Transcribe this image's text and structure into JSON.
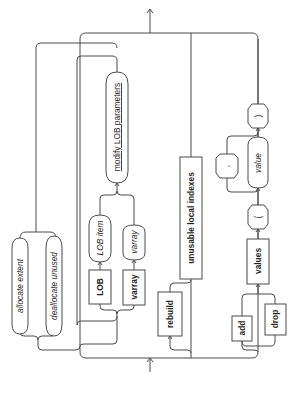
{
  "diagram": {
    "type": "syntax-railroad-diagram",
    "orientation": "rotated 90 degrees counter-clockwise (flows bottom to top)",
    "entry_arrow": "bottom",
    "exit_arrow": "top",
    "colors": {
      "line": "#4a4a4a",
      "text": "#1e1e1e",
      "background": "#ffffff"
    }
  },
  "branches": {
    "allocate_group": {
      "items": [
        {
          "label": "allocate extent",
          "style": "italic",
          "shape": "rounded"
        },
        {
          "label": "deallocate unused",
          "style": "italic",
          "shape": "rounded"
        }
      ]
    },
    "lob_group": {
      "items": [
        {
          "label": "LOB",
          "style": "bold",
          "shape": "box"
        },
        {
          "label": "LOB item",
          "style": "italic",
          "shape": "rounded"
        },
        {
          "label": "varray",
          "style": "bold",
          "shape": "box"
        },
        {
          "label": "varray",
          "style": "italic",
          "shape": "rounded"
        }
      ],
      "after": {
        "label": "modify LOB parameters",
        "style": "underline",
        "shape": "rounded"
      }
    },
    "rebuild_group": {
      "optional": {
        "label": "rebuild",
        "style": "bold",
        "shape": "box"
      },
      "keyword": {
        "label": "unusable local indexes",
        "style": "bold",
        "shape": "box"
      }
    },
    "values_group": {
      "choice": [
        {
          "label": "add",
          "style": "bold",
          "shape": "box"
        },
        {
          "label": "drop",
          "style": "bold",
          "shape": "box"
        }
      ],
      "keyword": {
        "label": "values",
        "style": "bold",
        "shape": "box"
      },
      "open_paren": {
        "label": "(",
        "shape": "rounded"
      },
      "value": {
        "label": "value",
        "style": "italic",
        "shape": "rounded"
      },
      "separator": {
        "label": ",",
        "shape": "rounded"
      },
      "close_paren": {
        "label": ")",
        "shape": "rounded"
      }
    }
  }
}
